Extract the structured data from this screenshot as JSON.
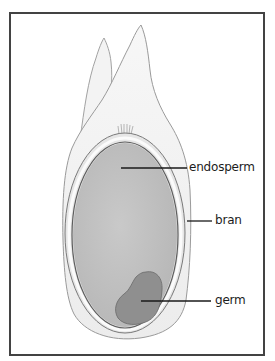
{
  "diagram": {
    "labels": {
      "endosperm": "endosperm",
      "bran": "bran",
      "germ": "germ"
    },
    "colors": {
      "frame": "#434343",
      "husk_fill": "#f1f1f1",
      "husk_stroke": "#9a9a9a",
      "bran_fill": "#e9e9e9",
      "bran_highlight": "#fbfbfb",
      "bran_stroke": "#6f6f6f",
      "endosperm_fill": "#c2c2c2",
      "germ_fill": "#8d8d8d",
      "leader_line": "#1a1a1a"
    }
  }
}
